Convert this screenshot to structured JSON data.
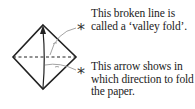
{
  "notes": [
    {
      "id": "valley-fold",
      "text": "This broken line is called a ‘valley fold’."
    },
    {
      "id": "fold-arrow",
      "text": "This arrow shows in which direction to fold the paper."
    }
  ],
  "markers": [
    {
      "symbol": "*"
    },
    {
      "symbol": "*"
    }
  ],
  "colors": {
    "line": "#222222",
    "leader": "#999999",
    "text": "#222222"
  }
}
